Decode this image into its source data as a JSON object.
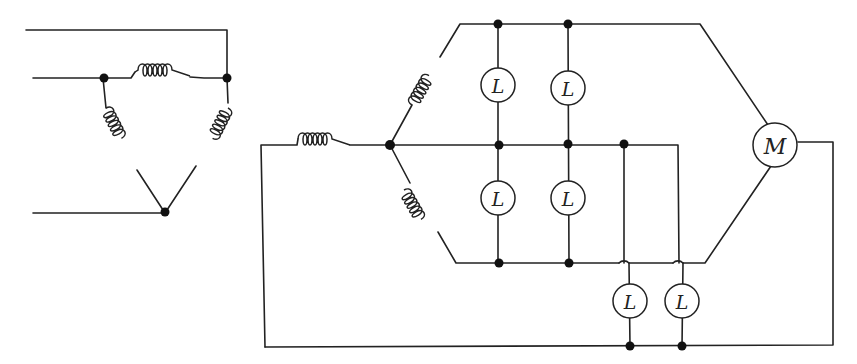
{
  "diagram": {
    "type": "circuit-schematic",
    "left_circuit": {
      "description": "Delta-connected three-phase windings",
      "coils": 3,
      "junctions": 3,
      "lines_in": 3
    },
    "right_circuit": {
      "description": "Star-connected windings feeding lamps and motor",
      "coils": 3,
      "junctions": 9,
      "lamp_label": "L",
      "lamp_count": 6,
      "motor_label": "M",
      "crossovers": 2
    },
    "labels": {
      "lamp1": "L",
      "lamp2": "L",
      "lamp3": "L",
      "lamp4": "L",
      "lamp5": "L",
      "lamp6": "L",
      "motor": "M"
    },
    "colors": {
      "stroke": "#222222",
      "background": "#ffffff"
    }
  }
}
